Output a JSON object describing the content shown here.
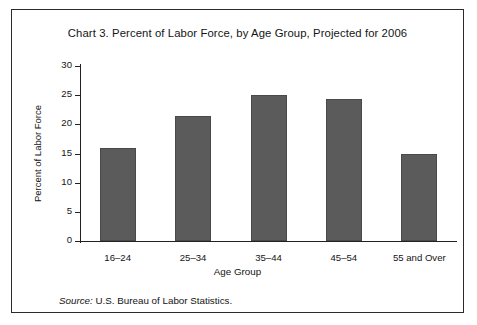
{
  "figure": {
    "title": "Chart 3. Percent of Labor Force, by Age Group, Projected for 2006",
    "source_label": "Source:",
    "source_text": "U.S. Bureau of Labor Statistics.",
    "border_color": "#2b2b2b",
    "bar_color": "#5b5b5b"
  },
  "chart_data": {
    "type": "bar",
    "title": "Chart 3. Percent of Labor Force, by Age Group, Projected for 2006",
    "xlabel": "Age Group",
    "ylabel": "Percent of Labor Force",
    "categories": [
      "16–24",
      "25–34",
      "35–44",
      "45–54",
      "55 and Over"
    ],
    "values": [
      16.0,
      21.5,
      25.1,
      24.3,
      15.0
    ],
    "ylim": [
      0,
      30
    ],
    "ytick_labels": [
      "0",
      "5",
      "10",
      "15",
      "20",
      "25",
      "30"
    ],
    "ytick_values": [
      0,
      5,
      10,
      15,
      20,
      25,
      30
    ],
    "grid": false,
    "legend": false,
    "bar_color": "#5b5b5b"
  }
}
